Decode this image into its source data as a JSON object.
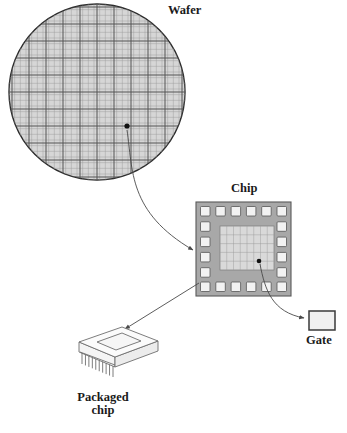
{
  "figure": {
    "background": "#ffffff",
    "width": 347,
    "height": 433
  },
  "labels": {
    "wafer": "Wafer",
    "chip": "Chip",
    "gate": "Gate",
    "packaged_chip_line1": "Packaged",
    "packaged_chip_line2": "chip"
  },
  "colors": {
    "wafer_fill": "#d6d6d6",
    "wafer_stroke": "#2b2b2b",
    "wafer_grid_major": "#4a4a4a",
    "wafer_grid_minor": "#8f8f8f",
    "chip_body": "#a8a8a8",
    "chip_core": "#d9d9d9",
    "pad_fill": "#f2f2f2",
    "pad_stroke": "#555555",
    "gate_fill": "#f0f0f0",
    "gate_stroke": "#3a3a3a",
    "package_fill": "#fbfbfb",
    "package_stroke": "#6e6e6e",
    "arrow": "#4a4a4a",
    "text": "#1a1a1a",
    "marker_dot": "#111111"
  },
  "wafer": {
    "center_x": 97,
    "center_y": 92,
    "radius": 88,
    "grid_major_step": 17,
    "grid_minor_divisions": 3,
    "marker_dot": {
      "x": 127,
      "y": 126,
      "r": 2.6
    }
  },
  "chip": {
    "x": 196,
    "y": 202,
    "width": 95,
    "height": 94,
    "frame_thickness": 5,
    "pads_top": 6,
    "pads_bottom": 6,
    "pads_left": 6,
    "pads_right": 6,
    "core": {
      "x": 224,
      "y": 228,
      "width": 50,
      "height": 39
    },
    "core_cols": 8,
    "core_rows": 5,
    "marker_dot": {
      "x": 259,
      "y": 261,
      "r": 2.3
    }
  },
  "gate_box": {
    "x": 309,
    "y": 311,
    "width": 26,
    "height": 19
  },
  "packaged_chip": {
    "top_face": [
      [
        79,
        342
      ],
      [
        122,
        327
      ],
      [
        158,
        341
      ],
      [
        115,
        357
      ]
    ],
    "cavity": [
      [
        95,
        342
      ],
      [
        121,
        333
      ],
      [
        142,
        341
      ],
      [
        116,
        351
      ]
    ],
    "front_face_height": 10,
    "pin_count": 10
  },
  "arrows": [
    {
      "name": "wafer-to-chip",
      "type": "curved",
      "from": {
        "x": 127,
        "y": 129
      },
      "to": {
        "x": 195,
        "y": 250
      },
      "control": {
        "x": 135,
        "y": 215
      }
    },
    {
      "name": "chip-to-gate",
      "type": "curved",
      "from": {
        "x": 260,
        "y": 264
      },
      "to": {
        "x": 306,
        "y": 318
      },
      "control": {
        "x": 268,
        "y": 312
      }
    },
    {
      "name": "chip-to-packaged-chip",
      "type": "straight",
      "from": {
        "x": 198,
        "y": 283
      },
      "to": {
        "x": 123,
        "y": 330
      }
    }
  ]
}
